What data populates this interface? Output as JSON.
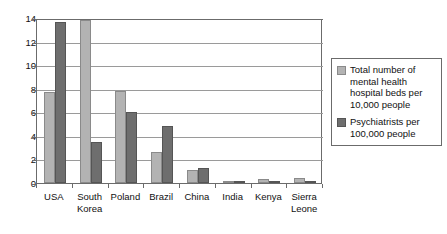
{
  "chart_data": {
    "type": "bar",
    "title": "",
    "xlabel": "",
    "ylabel": "",
    "ylim": [
      0,
      14
    ],
    "yticks": [
      0,
      2,
      4,
      6,
      8,
      10,
      12,
      14
    ],
    "grid": true,
    "legend_position": "right",
    "categories": [
      "USA",
      "South Korea",
      "Poland",
      "Brazil",
      "China",
      "India",
      "Kenya",
      "Sierra Leone"
    ],
    "series": [
      {
        "name": "Total number of mental health hospital beds per 10,000 people",
        "color": "#b3b3b3",
        "values": [
          7.7,
          13.8,
          7.8,
          2.6,
          1.1,
          0.2,
          0.3,
          0.45
        ]
      },
      {
        "name": "Psychiatrists per 100,000 people",
        "color": "#6e6e6e",
        "values": [
          13.7,
          3.5,
          6.0,
          4.8,
          1.3,
          0.1,
          0.1,
          0.05
        ]
      }
    ]
  },
  "legend": {
    "entries": [
      {
        "line1": "Total number of",
        "line2": "mental health",
        "line3": "hospital beds per",
        "line4": "10,000 people"
      },
      {
        "line1": "Psychiatrists per",
        "line2": "100,000 people"
      }
    ]
  },
  "axis": {
    "y_tick_labels": [
      "14",
      "12",
      "10",
      "8",
      "6",
      "4",
      "2",
      "0"
    ],
    "x_tick_labels": [
      {
        "line1": "USA",
        "line2": ""
      },
      {
        "line1": "South",
        "line2": "Korea"
      },
      {
        "line1": "Poland",
        "line2": ""
      },
      {
        "line1": "Brazil",
        "line2": ""
      },
      {
        "line1": "China",
        "line2": ""
      },
      {
        "line1": "India",
        "line2": ""
      },
      {
        "line1": "Kenya",
        "line2": ""
      },
      {
        "line1": "Sierra",
        "line2": "Leone"
      }
    ]
  }
}
